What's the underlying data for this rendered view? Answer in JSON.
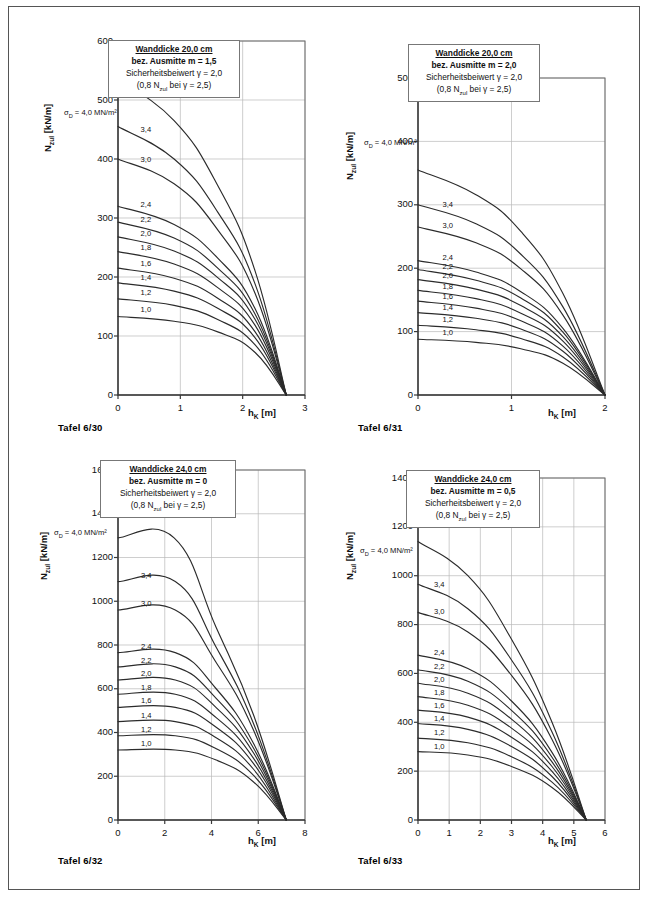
{
  "page": {
    "width": 650,
    "height": 899,
    "border_color": "#555555"
  },
  "common": {
    "ylabel": "N_zul [kN/m]",
    "ylabel_main": "N",
    "ylabel_sub": "zul",
    "ylabel_unit": " [kN/m]",
    "xlabel_main": "h",
    "xlabel_sub": "K",
    "xlabel_unit": " [m]",
    "sigma_label_main": "σ",
    "sigma_label_sub": "D",
    "sigma_label_rest": " = 4,0 MN/m²",
    "legend_line3": "Sicherheitsbeiwert γ = 2,0",
    "legend_line4_a": "(0,8   N",
    "legend_line4_sub": "zul",
    "legend_line4_b": " bei γ = 2,5)",
    "curve_labels": [
      "3,4",
      "3,0",
      "2,4",
      "2,2",
      "2,0",
      "1,8",
      "1,6",
      "1,4",
      "1,2",
      "1,0"
    ]
  },
  "charts": [
    {
      "id": "tafel-6-30",
      "caption": "Tafel 6/30",
      "legend": {
        "line1": "Wanddicke 20,0 cm",
        "line2": "bez. Ausmitte m = 1,5"
      },
      "chart_data": {
        "type": "line",
        "title": "Wanddicke 20,0 cm / bez. Ausmitte m = 1,5",
        "xlabel": "h_K [m]",
        "ylabel": "N_zul [kN/m]",
        "xlim": [
          0,
          3
        ],
        "ylim": [
          0,
          600
        ],
        "xticks": [
          0,
          1,
          2,
          3
        ],
        "yticks": [
          0,
          100,
          200,
          300,
          400,
          500,
          600
        ],
        "grid": true,
        "legend_position": "none",
        "converge_x": 2.7,
        "series": [
          {
            "name": "4,0",
            "x": [
              0,
              0.9,
              1.6,
              2.2,
              2.7
            ],
            "y": [
              535,
              465,
              355,
              210,
              0
            ]
          },
          {
            "name": "3,4",
            "x": [
              0,
              0.9,
              1.6,
              2.2,
              2.7
            ],
            "y": [
              455,
              400,
              310,
              188,
              0
            ]
          },
          {
            "name": "3,0",
            "x": [
              0,
              0.9,
              1.6,
              2.2,
              2.7
            ],
            "y": [
              400,
              358,
              280,
              172,
              0
            ]
          },
          {
            "name": "2,4",
            "x": [
              0,
              0.9,
              1.6,
              2.2,
              2.7
            ],
            "y": [
              320,
              289,
              232,
              146,
              0
            ]
          },
          {
            "name": "2,2",
            "x": [
              0,
              0.9,
              1.6,
              2.2,
              2.7
            ],
            "y": [
              293,
              266,
              215,
              137,
              0
            ]
          },
          {
            "name": "2,0",
            "x": [
              0,
              0.9,
              1.6,
              2.2,
              2.7
            ],
            "y": [
              268,
              244,
              199,
              128,
              0
            ]
          },
          {
            "name": "1,8",
            "x": [
              0,
              0.9,
              1.6,
              2.2,
              2.7
            ],
            "y": [
              243,
              222,
              182,
              118,
              0
            ]
          },
          {
            "name": "1,6",
            "x": [
              0,
              0.9,
              1.6,
              2.2,
              2.7
            ],
            "y": [
              215,
              198,
              164,
              107,
              0
            ]
          },
          {
            "name": "1,4",
            "x": [
              0,
              0.9,
              1.6,
              2.2,
              2.7
            ],
            "y": [
              190,
              176,
              147,
              97,
              0
            ]
          },
          {
            "name": "1,2",
            "x": [
              0,
              0.9,
              1.6,
              2.2,
              2.7
            ],
            "y": [
              163,
              152,
              128,
              85,
              0
            ]
          },
          {
            "name": "1,0",
            "x": [
              0,
              0.9,
              1.6,
              2.2,
              2.7
            ],
            "y": [
              133,
              125,
              107,
              72,
              0
            ]
          }
        ]
      }
    },
    {
      "id": "tafel-6-31",
      "caption": "Tafel 6/31",
      "legend": {
        "line1": "Wanddicke 20,0 cm",
        "line2": "bez. Ausmitte m = 2,0"
      },
      "chart_data": {
        "type": "line",
        "title": "Wanddicke 20,0 cm / bez. Ausmitte m = 2,0",
        "xlabel": "h_K [m]",
        "ylabel": "N_zul [kN/m]",
        "xlim": [
          0,
          2
        ],
        "ylim": [
          0,
          500
        ],
        "xticks": [
          0,
          1,
          2
        ],
        "yticks": [
          0,
          100,
          200,
          300,
          400,
          500
        ],
        "grid": true,
        "legend_position": "none",
        "converge_x": 2.0,
        "series": [
          {
            "name": "4,0",
            "x": [
              0,
              0.62,
              1.1,
              1.55,
              2.0
            ],
            "y": [
              355,
              316,
              258,
              160,
              0
            ]
          },
          {
            "name": "3,4",
            "x": [
              0,
              0.62,
              1.1,
              1.55,
              2.0
            ],
            "y": [
              300,
              270,
              222,
              139,
              0
            ]
          },
          {
            "name": "3,0",
            "x": [
              0,
              0.62,
              1.1,
              1.55,
              2.0
            ],
            "y": [
              265,
              240,
              199,
              126,
              0
            ]
          },
          {
            "name": "2,4",
            "x": [
              0,
              0.62,
              1.1,
              1.55,
              2.0
            ],
            "y": [
              212,
              194,
              163,
              105,
              0
            ]
          },
          {
            "name": "2,2",
            "x": [
              0,
              0.62,
              1.1,
              1.55,
              2.0
            ],
            "y": [
              198,
              181,
              153,
              99,
              0
            ]
          },
          {
            "name": "2,0",
            "x": [
              0,
              0.62,
              1.1,
              1.55,
              2.0
            ],
            "y": [
              182,
              167,
              141,
              92,
              0
            ]
          },
          {
            "name": "1,8",
            "x": [
              0,
              0.62,
              1.1,
              1.55,
              2.0
            ],
            "y": [
              165,
              152,
              129,
              85,
              0
            ]
          },
          {
            "name": "1,6",
            "x": [
              0,
              0.62,
              1.1,
              1.55,
              2.0
            ],
            "y": [
              148,
              137,
              117,
              77,
              0
            ]
          },
          {
            "name": "1,4",
            "x": [
              0,
              0.62,
              1.1,
              1.55,
              2.0
            ],
            "y": [
              130,
              121,
              104,
              69,
              0
            ]
          },
          {
            "name": "1,2",
            "x": [
              0,
              0.62,
              1.1,
              1.55,
              2.0
            ],
            "y": [
              110,
              103,
              89,
              60,
              0
            ]
          },
          {
            "name": "1,0",
            "x": [
              0,
              0.62,
              1.1,
              1.55,
              2.0
            ],
            "y": [
              88,
              83,
              73,
              50,
              0
            ]
          }
        ]
      }
    },
    {
      "id": "tafel-6-32",
      "caption": "Tafel 6/32",
      "legend": {
        "line1": "Wanddicke 24,0 cm",
        "line2": "bez. Ausmitte m = 0"
      },
      "chart_data": {
        "type": "line",
        "title": "Wanddicke 24,0 cm / bez. Ausmitte m = 0",
        "xlabel": "h_K [m]",
        "ylabel": "N_zul [kN/m]",
        "xlim": [
          0,
          8
        ],
        "ylim": [
          0,
          1600
        ],
        "xticks": [
          0,
          2,
          4,
          6,
          8
        ],
        "yticks": [
          0,
          200,
          400,
          600,
          800,
          1000,
          1200,
          1400,
          1600
        ],
        "grid": true,
        "legend_position": "none",
        "converge_x": 7.2,
        "plateau_end_x": 2.4,
        "series": [
          {
            "name": "4,0",
            "x": [
              0,
              2.4,
              4.2,
              5.8,
              7.2
            ],
            "y": [
              1290,
              1290,
              880,
              480,
              0
            ]
          },
          {
            "name": "3,4",
            "x": [
              0,
              2.45,
              4.2,
              5.8,
              7.2
            ],
            "y": [
              1090,
              1090,
              790,
              440,
              0
            ]
          },
          {
            "name": "3,0",
            "x": [
              0,
              2.45,
              4.2,
              5.8,
              7.2
            ],
            "y": [
              960,
              960,
              720,
              410,
              0
            ]
          },
          {
            "name": "2,4",
            "x": [
              0,
              2.45,
              4.2,
              5.8,
              7.2
            ],
            "y": [
              765,
              765,
              600,
              350,
              0
            ]
          },
          {
            "name": "2,2",
            "x": [
              0,
              2.45,
              4.2,
              5.8,
              7.2
            ],
            "y": [
              700,
              700,
              556,
              328,
              0
            ]
          },
          {
            "name": "2,0",
            "x": [
              0,
              2.45,
              4.2,
              5.8,
              7.2
            ],
            "y": [
              640,
              640,
              514,
              306,
              0
            ]
          },
          {
            "name": "1,8",
            "x": [
              0,
              2.45,
              4.2,
              5.8,
              7.2
            ],
            "y": [
              575,
              575,
              468,
              282,
              0
            ]
          },
          {
            "name": "1,6",
            "x": [
              0,
              2.45,
              4.2,
              5.8,
              7.2
            ],
            "y": [
              515,
              515,
              424,
              258,
              0
            ]
          },
          {
            "name": "1,4",
            "x": [
              0,
              2.45,
              4.2,
              5.8,
              7.2
            ],
            "y": [
              450,
              450,
              376,
              232,
              0
            ]
          },
          {
            "name": "1,2",
            "x": [
              0,
              2.45,
              4.2,
              5.8,
              7.2
            ],
            "y": [
              385,
              385,
              326,
              204,
              0
            ]
          },
          {
            "name": "1,0",
            "x": [
              0,
              2.45,
              4.2,
              5.8,
              7.2
            ],
            "y": [
              320,
              320,
              274,
              174,
              0
            ]
          }
        ]
      }
    },
    {
      "id": "tafel-6-33",
      "caption": "Tafel 6/33",
      "legend": {
        "line1": "Wanddicke 24,0 cm",
        "line2": "bez. Ausmitte m = 0,5"
      },
      "chart_data": {
        "type": "line",
        "title": "Wanddicke 24,0 cm / bez. Ausmitte m = 0,5",
        "xlabel": "h_K [m]",
        "ylabel": "N_zul [kN/m]",
        "xlim": [
          0,
          6
        ],
        "ylim": [
          0,
          1400
        ],
        "xticks": [
          0,
          1,
          2,
          3,
          4,
          5,
          6
        ],
        "yticks": [
          0,
          200,
          400,
          600,
          800,
          1000,
          1200,
          1400
        ],
        "grid": true,
        "legend_position": "none",
        "converge_x": 5.4,
        "series": [
          {
            "name": "4,0",
            "x": [
              0,
              1.6,
              3.0,
              4.3,
              5.4
            ],
            "y": [
              1140,
              1000,
              740,
              400,
              0
            ]
          },
          {
            "name": "3,4",
            "x": [
              0,
              1.6,
              3.0,
              4.3,
              5.4
            ],
            "y": [
              965,
              865,
              655,
              360,
              0
            ]
          },
          {
            "name": "3,0",
            "x": [
              0,
              1.6,
              3.0,
              4.3,
              5.4
            ],
            "y": [
              850,
              770,
              592,
              330,
              0
            ]
          },
          {
            "name": "2,4",
            "x": [
              0,
              1.6,
              3.0,
              4.3,
              5.4
            ],
            "y": [
              675,
              620,
              487,
              277,
              0
            ]
          },
          {
            "name": "2,2",
            "x": [
              0,
              1.6,
              3.0,
              4.3,
              5.4
            ],
            "y": [
              615,
              568,
              449,
              257,
              0
            ]
          },
          {
            "name": "2,0",
            "x": [
              0,
              1.6,
              3.0,
              4.3,
              5.4
            ],
            "y": [
              560,
              519,
              413,
              238,
              0
            ]
          },
          {
            "name": "1,8",
            "x": [
              0,
              1.6,
              3.0,
              4.3,
              5.4
            ],
            "y": [
              505,
              470,
              376,
              219,
              0
            ]
          },
          {
            "name": "1,6",
            "x": [
              0,
              1.6,
              3.0,
              4.3,
              5.4
            ],
            "y": [
              450,
              421,
              339,
              199,
              0
            ]
          },
          {
            "name": "1,4",
            "x": [
              0,
              1.6,
              3.0,
              4.3,
              5.4
            ],
            "y": [
              395,
              371,
              301,
              178,
              0
            ]
          },
          {
            "name": "1,2",
            "x": [
              0,
              1.6,
              3.0,
              4.3,
              5.4
            ],
            "y": [
              335,
              316,
              259,
              155,
              0
            ]
          },
          {
            "name": "1,0",
            "x": [
              0,
              1.6,
              3.0,
              4.3,
              5.4
            ],
            "y": [
              280,
              266,
              219,
              133,
              0
            ]
          }
        ]
      }
    }
  ]
}
